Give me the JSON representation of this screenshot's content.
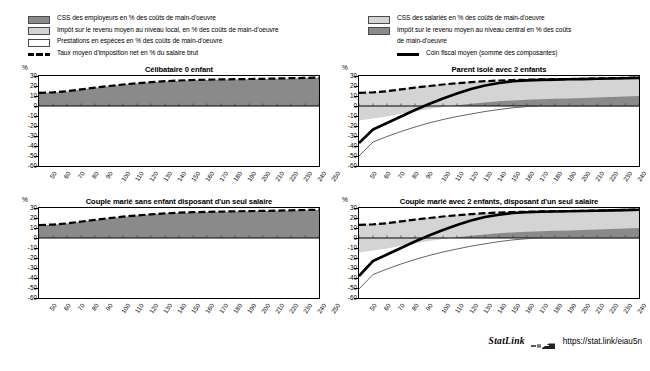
{
  "legend": {
    "left_items": [
      {
        "marker": "dark-swatch",
        "label": "CSS des employeurs en % des coûts de main-d'oeuvre"
      },
      {
        "marker": "light-swatch",
        "label": "Impôt sur le revenu moyen au niveau local, en % des coûts de main-d'oeuvre"
      },
      {
        "marker": "white-swatch",
        "label": "Prestations en espèces en % des coûts de main-d'oeuvre"
      },
      {
        "marker": "dashed-line",
        "label": "Taux moyen d'imposition net en % du salaire brut"
      }
    ],
    "right_items": [
      {
        "marker": "light-swatch",
        "label": "CSS des salariés en % des coûts de main-d'oeuvre"
      },
      {
        "marker": "dark-swatch",
        "label": "Impôt sur le revenu moyen au niveau central en %  des coûts"
      },
      {
        "marker": "none",
        "label": "de main-d'oeuvre"
      },
      {
        "marker": "solid-line",
        "label": "Coin fiscal moyen (somme des composantes)"
      }
    ]
  },
  "footer": {
    "statlink_word": "StatLink",
    "statlink_icon": "statlink-glyph-icon",
    "url": "https://stat.link/eiau5n"
  },
  "colors": {
    "employer_ssc": "#8a8a8a",
    "employee_ssc": "#d4d4d4",
    "central_tax": "#8a8a8a",
    "local_tax": "#d4d4d4",
    "cash_benefits": "#ffffff",
    "net_tax_rate_line": "#000000",
    "tax_wedge_line": "#000000",
    "thin_line": "#555555",
    "frame": "#000000"
  },
  "chart_data": [
    {
      "type": "area",
      "panel_id": "celibataire-0-enfant",
      "title": "Célibataire 0 enfant",
      "xlabel": "",
      "ylabel": "%",
      "ylim": [
        -60,
        30
      ],
      "xlim": [
        50,
        250
      ],
      "yticks": [
        30,
        20,
        10,
        0,
        -10,
        -20,
        -30,
        -40,
        -50,
        -60
      ],
      "xticks": [
        50,
        60,
        70,
        80,
        90,
        100,
        110,
        120,
        130,
        140,
        150,
        160,
        170,
        180,
        190,
        200,
        210,
        220,
        230,
        240,
        250
      ],
      "grid": false,
      "legend_position": "top",
      "x": [
        50,
        60,
        70,
        80,
        90,
        100,
        110,
        120,
        130,
        140,
        150,
        160,
        170,
        180,
        190,
        200,
        210,
        220,
        230,
        240,
        250
      ],
      "series": [
        {
          "name": "Coin fiscal moyen (somme des composantes)",
          "type": "area-stack-top",
          "values": [
            13.0,
            13.4,
            14.6,
            16.4,
            18.2,
            19.8,
            21.3,
            22.6,
            23.7,
            24.6,
            25.3,
            25.8,
            26.1,
            26.4,
            26.6,
            26.8,
            27.0,
            27.3,
            27.6,
            27.9,
            28.2
          ]
        },
        {
          "name": "Taux moyen d'imposition net en % du salaire brut",
          "type": "dashed-line",
          "values": [
            13.2,
            13.6,
            14.8,
            16.6,
            18.4,
            20.0,
            21.5,
            22.8,
            23.9,
            24.8,
            25.5,
            26.0,
            26.3,
            26.6,
            26.8,
            27.0,
            27.2,
            27.5,
            27.8,
            28.1,
            28.4
          ]
        }
      ]
    },
    {
      "type": "area",
      "panel_id": "parent-isole-2-enfants",
      "title": "Parent isolé avec 2 enfants",
      "xlabel": "",
      "ylabel": "%",
      "ylim": [
        -60,
        30
      ],
      "xlim": [
        50,
        250
      ],
      "yticks": [
        30,
        20,
        10,
        0,
        -10,
        -20,
        -30,
        -40,
        -50,
        -60
      ],
      "xticks": [
        50,
        60,
        70,
        80,
        90,
        100,
        110,
        120,
        130,
        140,
        150,
        160,
        170,
        180,
        190,
        200,
        210,
        220,
        230,
        240,
        250
      ],
      "grid": false,
      "legend_position": "top",
      "x": [
        50,
        60,
        70,
        80,
        90,
        100,
        110,
        120,
        130,
        140,
        150,
        160,
        170,
        180,
        190,
        200,
        210,
        220,
        230,
        240,
        250
      ],
      "series": [
        {
          "name": "CSS des employeurs en % des coûts de main-d'oeuvre",
          "type": "area-dark-top",
          "values": [
            13.0,
            13.4,
            14.6,
            16.4,
            18.2,
            19.8,
            21.3,
            22.6,
            23.7,
            24.6,
            25.3,
            25.8,
            26.1,
            26.4,
            26.6,
            26.8,
            27.0,
            27.3,
            27.6,
            27.9,
            28.2
          ]
        },
        {
          "name": "CSS des salariés en % des coûts de main-d'oeuvre",
          "type": "area-light-band",
          "values": [
            27.5,
            26.0,
            25.0,
            24.2,
            23.5,
            22.9,
            22.3,
            21.8,
            21.4,
            21.0,
            20.6,
            20.2,
            19.9,
            19.6,
            19.4,
            19.2,
            19.0,
            18.8,
            18.6,
            18.4,
            18.2
          ]
        },
        {
          "name": "Coin fiscal moyen (somme des composantes)",
          "type": "thick-line",
          "values": [
            -37.0,
            -23.5,
            -17.0,
            -10.5,
            -4.0,
            2.0,
            7.5,
            12.5,
            17.0,
            20.5,
            23.0,
            24.8,
            25.6,
            26.1,
            26.4,
            26.7,
            26.9,
            27.2,
            27.5,
            27.8,
            28.1
          ]
        },
        {
          "name": "Prestations en espèces en % des coûts de main-d'oeuvre",
          "type": "thin-line",
          "values": [
            -50.0,
            -36.0,
            -30.5,
            -25.5,
            -21.0,
            -17.0,
            -13.5,
            -10.5,
            -8.0,
            -5.5,
            -3.5,
            -1.8,
            -0.6,
            0.0,
            0.0,
            0.0,
            0.0,
            0.0,
            0.0,
            0.0,
            0.0
          ]
        },
        {
          "name": "Taux moyen d'imposition net en % du salaire brut",
          "type": "dashed-line",
          "values": [
            13.2,
            13.6,
            14.8,
            16.6,
            18.4,
            20.0,
            21.5,
            22.8,
            23.9,
            24.8,
            25.5,
            26.0,
            26.3,
            26.6,
            26.8,
            27.0,
            27.2,
            27.5,
            27.8,
            28.1,
            28.4
          ]
        }
      ]
    },
    {
      "type": "area",
      "panel_id": "couple-marie-sans-enfant",
      "title": "Couple marié sans enfant disposant d'un seul salaire",
      "xlabel": "",
      "ylabel": "%",
      "ylim": [
        -60,
        30
      ],
      "xlim": [
        50,
        250
      ],
      "yticks": [
        30,
        20,
        10,
        0,
        -10,
        -20,
        -30,
        -40,
        -50,
        -60
      ],
      "xticks": [
        50,
        60,
        70,
        80,
        90,
        100,
        110,
        120,
        130,
        140,
        150,
        160,
        170,
        180,
        190,
        200,
        210,
        220,
        230,
        240,
        250
      ],
      "grid": false,
      "legend_position": "top",
      "x": [
        50,
        60,
        70,
        80,
        90,
        100,
        110,
        120,
        130,
        140,
        150,
        160,
        170,
        180,
        190,
        200,
        210,
        220,
        230,
        240,
        250
      ],
      "series": [
        {
          "name": "Coin fiscal moyen (somme des composantes)",
          "type": "area-stack-top",
          "values": [
            12.8,
            13.2,
            14.4,
            16.2,
            18.0,
            19.6,
            21.1,
            22.4,
            23.5,
            24.4,
            25.1,
            25.6,
            25.9,
            26.2,
            26.5,
            26.7,
            26.9,
            27.2,
            27.5,
            27.8,
            28.1
          ]
        },
        {
          "name": "Taux moyen d'imposition net en % du salaire brut",
          "type": "dashed-line",
          "values": [
            13.0,
            13.4,
            14.6,
            16.4,
            18.2,
            19.8,
            21.3,
            22.6,
            23.7,
            24.6,
            25.3,
            25.8,
            26.1,
            26.4,
            26.7,
            26.9,
            27.1,
            27.4,
            27.7,
            28.0,
            28.3
          ]
        }
      ]
    },
    {
      "type": "area",
      "panel_id": "couple-marie-2-enfants",
      "title": "Couple marié avec 2 enfants, disposant d'un seul salaire",
      "xlabel": "",
      "ylabel": "%",
      "ylim": [
        -60,
        30
      ],
      "xlim": [
        50,
        250
      ],
      "yticks": [
        30,
        20,
        10,
        0,
        -10,
        -20,
        -30,
        -40,
        -50,
        -60
      ],
      "xticks": [
        50,
        60,
        70,
        80,
        90,
        100,
        110,
        120,
        130,
        140,
        150,
        160,
        170,
        180,
        190,
        200,
        210,
        220,
        230,
        240,
        250
      ],
      "grid": false,
      "legend_position": "top",
      "x": [
        50,
        60,
        70,
        80,
        90,
        100,
        110,
        120,
        130,
        140,
        150,
        160,
        170,
        180,
        190,
        200,
        210,
        220,
        230,
        240,
        250
      ],
      "series": [
        {
          "name": "CSS des employeurs en % des coûts de main-d'oeuvre",
          "type": "area-dark-top",
          "values": [
            13.0,
            13.4,
            14.6,
            16.4,
            18.2,
            19.8,
            21.3,
            22.6,
            23.7,
            24.6,
            25.3,
            25.8,
            26.1,
            26.4,
            26.6,
            26.8,
            27.0,
            27.3,
            27.6,
            27.9,
            28.2
          ]
        },
        {
          "name": "CSS des salariés en % des coûts de main-d'oeuvre",
          "type": "area-light-band",
          "values": [
            27.5,
            26.0,
            25.0,
            24.2,
            23.5,
            22.9,
            22.3,
            21.8,
            21.4,
            21.0,
            20.6,
            20.2,
            19.9,
            19.6,
            19.4,
            19.2,
            19.0,
            18.8,
            18.6,
            18.4,
            18.2
          ]
        },
        {
          "name": "Coin fiscal moyen (somme des composantes)",
          "type": "thick-line",
          "values": [
            -38.0,
            -23.0,
            -16.5,
            -10.0,
            -3.5,
            2.5,
            8.0,
            13.0,
            17.5,
            21.0,
            23.3,
            25.0,
            25.7,
            26.2,
            26.5,
            26.8,
            27.0,
            27.3,
            27.6,
            27.9,
            28.2
          ]
        },
        {
          "name": "Prestations en espèces en % des coûts de main-d'oeuvre",
          "type": "thin-line",
          "values": [
            -51.0,
            -36.5,
            -31.0,
            -26.0,
            -21.5,
            -17.5,
            -14.0,
            -11.0,
            -8.2,
            -5.8,
            -3.6,
            -1.9,
            -0.7,
            0.0,
            0.0,
            0.0,
            0.0,
            0.0,
            0.0,
            0.0,
            0.0
          ]
        },
        {
          "name": "Taux moyen d'imposition net en % du salaire brut",
          "type": "dashed-line",
          "values": [
            13.2,
            13.6,
            14.8,
            16.6,
            18.4,
            20.0,
            21.5,
            22.8,
            23.9,
            24.8,
            25.5,
            26.0,
            26.3,
            26.6,
            26.8,
            27.0,
            27.2,
            27.5,
            27.8,
            28.1,
            28.4
          ]
        }
      ]
    }
  ]
}
